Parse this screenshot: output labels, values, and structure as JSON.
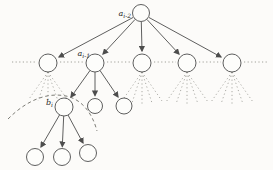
{
  "figure": {
    "width": 273,
    "height": 170,
    "colors": {
      "background": "#fcfbf9",
      "line": "#4d4d4d",
      "node_fill": "#fdfdfb",
      "dotted": "#979790",
      "dashed": "#6e6e68",
      "label": "#2b2b2b"
    }
  },
  "diagram": {
    "nodes": [
      {
        "id": "root",
        "x": 141,
        "y": 13,
        "r": 8.5
      },
      {
        "id": "l2-1",
        "x": 48,
        "y": 63,
        "r": 9
      },
      {
        "id": "l2-2",
        "x": 95,
        "y": 63,
        "r": 9
      },
      {
        "id": "l2-3",
        "x": 142,
        "y": 63,
        "r": 9
      },
      {
        "id": "l2-4",
        "x": 187,
        "y": 63,
        "r": 9
      },
      {
        "id": "l2-5",
        "x": 232,
        "y": 63,
        "r": 9
      },
      {
        "id": "l3-b",
        "x": 64,
        "y": 107,
        "r": 9
      },
      {
        "id": "l3-m",
        "x": 95,
        "y": 106,
        "r": 7.5
      },
      {
        "id": "l3-r",
        "x": 124,
        "y": 106,
        "r": 8
      },
      {
        "id": "l4-1",
        "x": 35,
        "y": 157,
        "r": 8.5
      },
      {
        "id": "l4-2",
        "x": 62,
        "y": 157,
        "r": 8.5
      },
      {
        "id": "l4-3",
        "x": 88,
        "y": 153,
        "r": 8.5
      }
    ],
    "edges": [
      {
        "from": "root",
        "to": "l2-1",
        "x1": 133,
        "y1": 17.5,
        "x2": 59,
        "y2": 57
      },
      {
        "from": "root",
        "to": "l2-2",
        "x1": 135,
        "y1": 19.5,
        "x2": 103,
        "y2": 54
      },
      {
        "from": "root",
        "to": "l2-3",
        "x1": 141.3,
        "y1": 22,
        "x2": 142,
        "y2": 51
      },
      {
        "from": "root",
        "to": "l2-4",
        "x1": 147,
        "y1": 19.5,
        "x2": 179,
        "y2": 54
      },
      {
        "from": "root",
        "to": "l2-5",
        "x1": 149,
        "y1": 17.5,
        "x2": 221,
        "y2": 57
      },
      {
        "from": "l2-2",
        "to": "l3-b",
        "x1": 90,
        "y1": 70.5,
        "x2": 71,
        "y2": 97
      },
      {
        "from": "l2-2",
        "to": "l3-m",
        "x1": 95,
        "y1": 72,
        "x2": 95,
        "y2": 95.5
      },
      {
        "from": "l2-2",
        "to": "l3-r",
        "x1": 100,
        "y1": 70.5,
        "x2": 118,
        "y2": 97
      },
      {
        "from": "l3-b",
        "to": "l4-1",
        "x1": 59.5,
        "y1": 115,
        "x2": 41,
        "y2": 147
      },
      {
        "from": "l3-b",
        "to": "l4-2",
        "x1": 63.7,
        "y1": 116,
        "x2": 62.3,
        "y2": 146.5
      },
      {
        "from": "l3-b",
        "to": "l4-3",
        "x1": 68,
        "y1": 115,
        "x2": 83,
        "y2": 143
      }
    ],
    "dotted_segments": [
      {
        "x1": 12,
        "x2": 36,
        "y": 62
      },
      {
        "x1": 60,
        "x2": 83,
        "y": 62
      },
      {
        "x1": 107,
        "x2": 130,
        "y": 62
      },
      {
        "x1": 154,
        "x2": 176,
        "y": 62
      },
      {
        "x1": 199,
        "x2": 221,
        "y": 62
      },
      {
        "x1": 244,
        "x2": 268,
        "y": 62
      }
    ],
    "fans": [
      {
        "node": "l2-1",
        "x": 48,
        "y": 72,
        "rays": [
          [
            29,
            99
          ],
          [
            38,
            101
          ],
          [
            48,
            102
          ],
          [
            58,
            101
          ],
          [
            67,
            99
          ]
        ]
      },
      {
        "node": "l2-3",
        "x": 142,
        "y": 72,
        "rays": [
          [
            122,
            101
          ],
          [
            132,
            103
          ],
          [
            142,
            104
          ],
          [
            152,
            103
          ],
          [
            162,
            101
          ]
        ]
      },
      {
        "node": "l2-4",
        "x": 187,
        "y": 72,
        "rays": [
          [
            166,
            102
          ],
          [
            176,
            104
          ],
          [
            187,
            105
          ],
          [
            198,
            104
          ],
          [
            208,
            102
          ]
        ]
      },
      {
        "node": "l2-5",
        "x": 232,
        "y": 72,
        "rays": [
          [
            211,
            102
          ],
          [
            221,
            104
          ],
          [
            232,
            105
          ],
          [
            243,
            104
          ],
          [
            253,
            102
          ]
        ]
      }
    ],
    "dashed_curve": "M 8 119 C 26 101 46 92 66 96 C 81 99 92 112 97 131",
    "labels": [
      {
        "id": "label-root",
        "main": "a",
        "sub": "i-2",
        "x": 131,
        "y": 16,
        "anchor": "end"
      },
      {
        "id": "label-l2-2",
        "main": "a",
        "sub": "i-1",
        "x": 90,
        "y": 56,
        "anchor": "end"
      },
      {
        "id": "label-l3-b",
        "main": "b",
        "sub": "i",
        "x": 53,
        "y": 105,
        "anchor": "end"
      }
    ]
  }
}
